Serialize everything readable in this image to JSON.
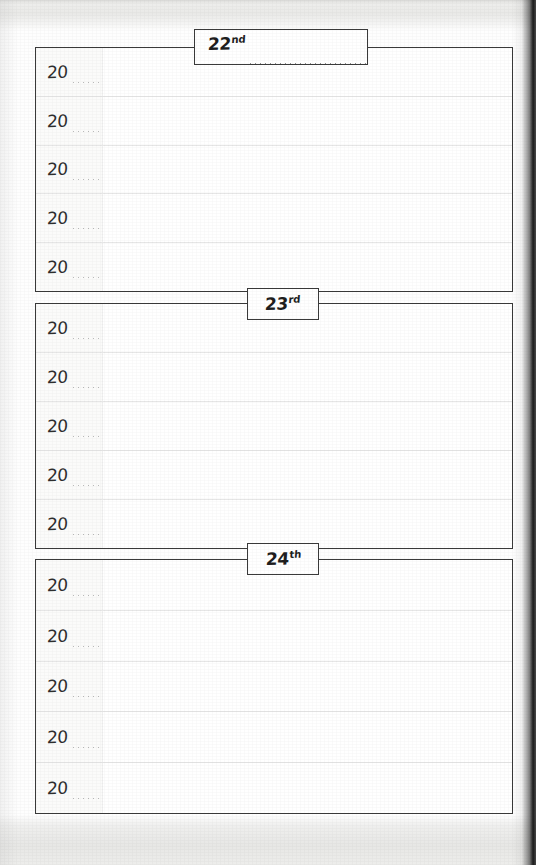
{
  "page": {
    "type": "planner-page",
    "kind": "perpetual-diary-three-day-spread",
    "paper_color": "#fefefe",
    "ink_color": "#3a3a3a",
    "edge_band_color": "#e9e9e7",
    "spine_shadow_color": "#141414"
  },
  "sections": [
    {
      "id": "section-22",
      "date_number": "22",
      "date_ordinal": "nd",
      "has_fill_dots": true,
      "rows": [
        {
          "year_prefix": "20",
          "year_blank": ""
        },
        {
          "year_prefix": "20",
          "year_blank": ""
        },
        {
          "year_prefix": "20",
          "year_blank": ""
        },
        {
          "year_prefix": "20",
          "year_blank": ""
        },
        {
          "year_prefix": "20",
          "year_blank": ""
        }
      ]
    },
    {
      "id": "section-23",
      "date_number": "23",
      "date_ordinal": "rd",
      "has_fill_dots": false,
      "rows": [
        {
          "year_prefix": "20",
          "year_blank": ""
        },
        {
          "year_prefix": "20",
          "year_blank": ""
        },
        {
          "year_prefix": "20",
          "year_blank": ""
        },
        {
          "year_prefix": "20",
          "year_blank": ""
        },
        {
          "year_prefix": "20",
          "year_blank": ""
        }
      ]
    },
    {
      "id": "section-24",
      "date_number": "24",
      "date_ordinal": "th",
      "has_fill_dots": false,
      "rows": [
        {
          "year_prefix": "20",
          "year_blank": ""
        },
        {
          "year_prefix": "20",
          "year_blank": ""
        },
        {
          "year_prefix": "20",
          "year_blank": ""
        },
        {
          "year_prefix": "20",
          "year_blank": ""
        },
        {
          "year_prefix": "20",
          "year_blank": ""
        }
      ]
    }
  ]
}
